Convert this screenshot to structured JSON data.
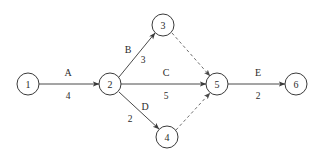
{
  "diagram": {
    "type": "activity-on-arrow-network",
    "background_color": "#ffffff",
    "stroke_color": "#4a4a4a",
    "dummy_stroke_color": "#6e6e6e",
    "text_color": "#2b2b2b",
    "node_radius": 11,
    "nodes": [
      {
        "id": "1",
        "label": "1",
        "cx": 28,
        "cy": 84
      },
      {
        "id": "2",
        "label": "2",
        "cx": 110,
        "cy": 84
      },
      {
        "id": "3",
        "label": "3",
        "cx": 163,
        "cy": 25
      },
      {
        "id": "4",
        "label": "4",
        "cx": 167,
        "cy": 137
      },
      {
        "id": "5",
        "label": "5",
        "cx": 217,
        "cy": 84
      },
      {
        "id": "6",
        "label": "6",
        "cx": 296,
        "cy": 84
      }
    ],
    "edges": [
      {
        "id": "A",
        "from": "1",
        "to": "2",
        "activity": "A",
        "duration": "4",
        "style": "solid",
        "arrow": true,
        "x1": 39,
        "y1": 84,
        "x2": 99,
        "y2": 84,
        "name_x": 68,
        "name_y": 72,
        "duration_x": 68,
        "duration_y": 96
      },
      {
        "id": "B",
        "from": "2",
        "to": "3",
        "activity": "B",
        "duration": "3",
        "style": "solid",
        "arrow": true,
        "x1": 119,
        "y1": 77,
        "x2": 155,
        "y2": 33,
        "name_x": 128,
        "name_y": 49,
        "duration_x": 143,
        "duration_y": 60
      },
      {
        "id": "C",
        "from": "2",
        "to": "5",
        "activity": "C",
        "duration": "5",
        "style": "solid",
        "arrow": true,
        "x1": 121,
        "y1": 84,
        "x2": 206,
        "y2": 84,
        "name_x": 166,
        "name_y": 72,
        "duration_x": 166,
        "duration_y": 96
      },
      {
        "id": "D",
        "from": "2",
        "to": "4",
        "activity": "D",
        "duration": "2",
        "style": "solid",
        "arrow": true,
        "x1": 119,
        "y1": 92,
        "x2": 159,
        "y2": 129,
        "name_x": 145,
        "name_y": 106,
        "duration_x": 130,
        "duration_y": 119
      },
      {
        "id": "E",
        "from": "5",
        "to": "6",
        "activity": "E",
        "duration": "2",
        "style": "solid",
        "arrow": true,
        "x1": 228,
        "y1": 84,
        "x2": 285,
        "y2": 84,
        "name_x": 258,
        "name_y": 72,
        "duration_x": 258,
        "duration_y": 96
      },
      {
        "id": "dummy-3-5",
        "from": "3",
        "to": "5",
        "activity": "",
        "duration": "",
        "style": "dashed",
        "arrow": true,
        "x1": 172,
        "y1": 33,
        "x2": 210,
        "y2": 76,
        "name_x": 0,
        "name_y": 0,
        "duration_x": 0,
        "duration_y": 0
      },
      {
        "id": "dummy-4-5",
        "from": "4",
        "to": "5",
        "activity": "",
        "duration": "",
        "style": "dashed",
        "arrow": true,
        "x1": 176,
        "y1": 130,
        "x2": 210,
        "y2": 93,
        "name_x": 0,
        "name_y": 0,
        "duration_x": 0,
        "duration_y": 0
      }
    ]
  }
}
